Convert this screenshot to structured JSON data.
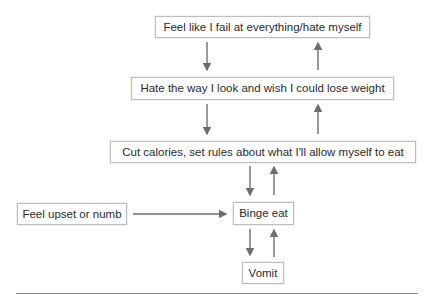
{
  "diagram": {
    "type": "flowchart",
    "nodes": [
      {
        "id": "fail",
        "label": "Feel like I fail at everything/hate myself"
      },
      {
        "id": "hate_look",
        "label": "Hate the way I look and wish I could lose weight"
      },
      {
        "id": "cut_calories",
        "label": "Cut calories, set rules about what I'll allow myself to eat"
      },
      {
        "id": "upset",
        "label": "Feel upset or numb"
      },
      {
        "id": "binge",
        "label": "Binge eat"
      },
      {
        "id": "vomit",
        "label": "Vomit"
      }
    ],
    "edges": [
      {
        "from": "fail",
        "to": "hate_look"
      },
      {
        "from": "hate_look",
        "to": "fail"
      },
      {
        "from": "hate_look",
        "to": "cut_calories"
      },
      {
        "from": "cut_calories",
        "to": "hate_look"
      },
      {
        "from": "cut_calories",
        "to": "binge"
      },
      {
        "from": "binge",
        "to": "cut_calories"
      },
      {
        "from": "upset",
        "to": "binge"
      },
      {
        "from": "binge",
        "to": "vomit"
      },
      {
        "from": "vomit",
        "to": "binge"
      }
    ],
    "colors": {
      "arrow": "#6e6e6e",
      "border": "#bdbdbd",
      "text": "#2a2a2a"
    }
  }
}
